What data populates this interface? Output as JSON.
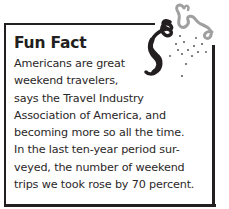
{
  "callout": {
    "title": "Fun Fact",
    "lines": [
      "Americans are great",
      "weekend travelers,",
      "says the Travel Industry",
      "Association of America, and",
      "becoming more so all the time.",
      "In the last ten-year period sur-",
      "veyed, the number of weekend",
      "trips we took rose by 70 percent."
    ],
    "decoration": "party-streamer-icon",
    "colors": {
      "text": "#231f20",
      "frame": "#231f20",
      "streamer_dark": "#231f20",
      "streamer_light": "#9a9a9a"
    }
  }
}
